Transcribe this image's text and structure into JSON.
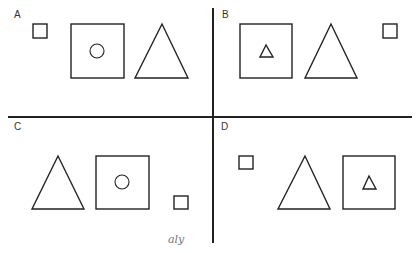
{
  "figure": {
    "stroke_color": "#222222",
    "background": "#ffffff",
    "dividers": {
      "horizontal": {
        "x1": 8,
        "x2": 412,
        "y": 117
      },
      "vertical": {
        "x": 213,
        "y1": 8,
        "y2": 243
      }
    },
    "panels": [
      {
        "label": "A",
        "label_pos": [
          14,
          10
        ],
        "shapes": [
          {
            "type": "square",
            "size": "small",
            "x": 33,
            "y": 24,
            "w": 14,
            "h": 14
          },
          {
            "type": "square",
            "size": "large",
            "x": 71,
            "y": 24,
            "w": 53,
            "h": 54,
            "contains": {
              "type": "circle",
              "cx": 97,
              "cy": 51,
              "r": 7
            }
          },
          {
            "type": "triangle",
            "size": "large",
            "points": [
              [
                162,
                24
              ],
              [
                135,
                78
              ],
              [
                188,
                78
              ]
            ]
          }
        ]
      },
      {
        "label": "B",
        "label_pos": [
          222,
          10
        ],
        "shapes": [
          {
            "type": "square",
            "size": "large",
            "x": 240,
            "y": 24,
            "w": 52,
            "h": 54,
            "contains": {
              "type": "triangle",
              "points": [
                [
                  266,
                  45
                ],
                [
                  260,
                  57
                ],
                [
                  273,
                  57
                ]
              ]
            }
          },
          {
            "type": "triangle",
            "size": "large",
            "points": [
              [
                331,
                24
              ],
              [
                305,
                78
              ],
              [
                357,
                78
              ]
            ]
          },
          {
            "type": "square",
            "size": "small",
            "x": 383,
            "y": 24,
            "w": 14,
            "h": 14
          }
        ]
      },
      {
        "label": "C",
        "label_pos": [
          14,
          122
        ],
        "shapes": [
          {
            "type": "triangle",
            "size": "large",
            "points": [
              [
                58,
                156
              ],
              [
                32,
                209
              ],
              [
                84,
                209
              ]
            ]
          },
          {
            "type": "square",
            "size": "large",
            "x": 96,
            "y": 156,
            "w": 53,
            "h": 53,
            "contains": {
              "type": "circle",
              "cx": 122,
              "cy": 182,
              "r": 7
            }
          },
          {
            "type": "square",
            "size": "small",
            "x": 174,
            "y": 196,
            "w": 14,
            "h": 13
          }
        ]
      },
      {
        "label": "D",
        "label_pos": [
          221,
          122
        ],
        "shapes": [
          {
            "type": "square",
            "size": "small",
            "x": 239,
            "y": 156,
            "w": 14,
            "h": 13
          },
          {
            "type": "triangle",
            "size": "large",
            "points": [
              [
                305,
                156
              ],
              [
                278,
                209
              ],
              [
                330,
                209
              ]
            ]
          },
          {
            "type": "square",
            "size": "large",
            "x": 343,
            "y": 156,
            "w": 52,
            "h": 53,
            "contains": {
              "type": "triangle",
              "points": [
                [
                  369,
                  176
                ],
                [
                  363,
                  189
                ],
                [
                  376,
                  189
                ]
              ]
            }
          }
        ]
      }
    ],
    "signature": {
      "text": "aly",
      "x": 168,
      "y": 234
    }
  }
}
